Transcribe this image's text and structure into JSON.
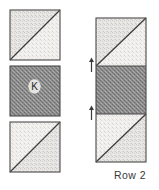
{
  "diagram": {
    "title": "Row 2",
    "caption": "Row 2",
    "type": "quilt-block-assembly",
    "palette": {
      "outline": "#4a4a4a",
      "diagonal_seam": "#3f3f3f",
      "light_fabric_a": "#e3e2e0",
      "light_fabric_b": "#efeeec",
      "dark_fabric": "#8d8d8d",
      "background": "#ffffff",
      "text": "#3a3a3a",
      "arrow": "#3a3a3a"
    },
    "left_column": {
      "name": "individual-blocks",
      "blocks": [
        {
          "id": "block-top",
          "name": "half-square-triangle-block-top",
          "kind": "half-square-triangle",
          "diagonal": "bottom-left-to-top-right",
          "upper_left_shade": "medium-light",
          "lower_right_shade": "light",
          "label": "",
          "x": 10,
          "y": 10,
          "width": 50,
          "height": 50
        },
        {
          "id": "block-middle",
          "name": "dark-square-block-k",
          "kind": "plain-square",
          "diagonal": "none",
          "shade": "dark",
          "label": "K",
          "x": 10,
          "y": 66,
          "width": 50,
          "height": 50
        },
        {
          "id": "block-bottom",
          "name": "half-square-triangle-block-bottom",
          "kind": "half-square-triangle",
          "diagonal": "bottom-left-to-top-right",
          "upper_left_shade": "light",
          "lower_right_shade": "medium-light",
          "label": "",
          "x": 10,
          "y": 122,
          "width": 50,
          "height": 50
        }
      ]
    },
    "right_column": {
      "name": "assembled-row-strip",
      "x": 96,
      "y": 18,
      "width": 50,
      "height": 144,
      "segments": [
        {
          "id": "strip-top",
          "name": "strip-segment-half-square-triangle-top",
          "kind": "half-square-triangle",
          "diagonal": "bottom-left-to-top-right",
          "shade": "light"
        },
        {
          "id": "strip-middle",
          "name": "strip-segment-dark-square",
          "kind": "plain-square",
          "diagonal": "none",
          "shade": "dark"
        },
        {
          "id": "strip-bottom",
          "name": "strip-segment-half-square-triangle-bottom",
          "kind": "half-square-triangle",
          "diagonal": "bottom-left-to-top-right",
          "shade": "light"
        }
      ],
      "seam_arrows": [
        {
          "id": "seam-arrow-upper",
          "name": "seam-direction-arrow-upper",
          "y": 66,
          "direction": "up"
        },
        {
          "id": "seam-arrow-lower",
          "name": "seam-direction-arrow-lower",
          "y": 114,
          "direction": "up"
        }
      ]
    }
  }
}
